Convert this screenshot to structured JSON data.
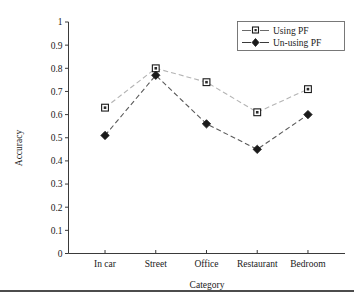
{
  "chart_data": {
    "type": "line",
    "title": "",
    "xlabel": "Category",
    "ylabel": "Accuracy",
    "categories": [
      "In car",
      "Street",
      "Office",
      "Restaurant",
      "Bedroom"
    ],
    "series": [
      {
        "name": "Using PF",
        "values": [
          0.63,
          0.8,
          0.74,
          0.61,
          0.71
        ],
        "marker": "open-square",
        "line_color": "#b4b4b4",
        "line_style": "dashed"
      },
      {
        "name": "Un-using PF",
        "values": [
          0.51,
          0.77,
          0.56,
          0.45,
          0.6
        ],
        "marker": "filled-diamond",
        "line_color": "#5a5a5a",
        "line_style": "dashed"
      }
    ],
    "ylim": [
      0,
      1
    ],
    "yticks": [
      "0",
      "0.1",
      "0.2",
      "0.3",
      "0.4",
      "0.5",
      "0.6",
      "0.7",
      "0.8",
      "0.9",
      "1"
    ],
    "grid": false,
    "legend_position": "top-right"
  },
  "axes": {
    "y_title": "Accuracy",
    "x_title": "Category",
    "y_tick_labels": [
      "1",
      "0.9",
      "0.8",
      "0.7",
      "0.6",
      "0.5",
      "0.4",
      "0.3",
      "0.2",
      "0.1",
      "0"
    ],
    "x_tick_labels": [
      "In car",
      "Street",
      "Office",
      "Restaurant",
      "Bedroom"
    ]
  },
  "legend": {
    "entries": [
      {
        "label": "Using PF",
        "marker": "open-square-marker"
      },
      {
        "label": "Un-using PF",
        "marker": "filled-diamond-marker"
      }
    ]
  },
  "colors": {
    "series_a_line": "#b4b4b4",
    "series_b_line": "#5a5a5a",
    "marker": "#1a1a1a",
    "axis": "#3a3a3a",
    "background": "#ffffff",
    "rule": "#111111"
  }
}
